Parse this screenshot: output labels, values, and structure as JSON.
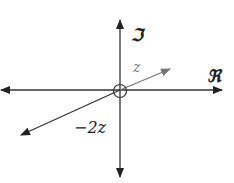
{
  "diagram": {
    "type": "complex-plane",
    "axes": {
      "real_label": "ℜ",
      "imag_label": "ℑ"
    },
    "vectors": [
      {
        "name": "z",
        "label": "z",
        "color": "#777777"
      },
      {
        "name": "-2z",
        "label": "−2z",
        "color": "#222222"
      }
    ],
    "origin_marker": "circle"
  }
}
